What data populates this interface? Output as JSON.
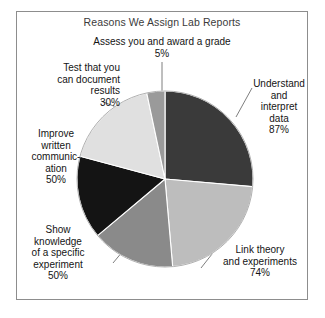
{
  "figure": {
    "title": "Reasons We Assign Lab Reports",
    "frame_color": "#8d8d8d",
    "background": "#ffffff"
  },
  "chart_data": {
    "type": "pie",
    "title": "Reasons We Assign Lab Reports",
    "xlabel": "",
    "ylabel": "",
    "legend_position": "none",
    "grid": false,
    "note": "Percentages are response rates that sum to more than 100% (multiple-select survey); slice angles are drawn proportional to the listed values.",
    "categories": [
      "Understand and interpret data",
      "Link theory and experiments",
      "Show knowledge of a specific experiment",
      "Improve written communication",
      "Test that you can document results",
      "Assess you and award a grade"
    ],
    "values": [
      87,
      74,
      50,
      50,
      30,
      5
    ],
    "value_labels": [
      "87%",
      "74%",
      "50%",
      "50%",
      "30%",
      "5%"
    ],
    "colors": [
      "#3a3a3a",
      "#bdbdbd",
      "#8a8a8a",
      "#141414",
      "#e0e0e0",
      "#9a9a9a"
    ],
    "slices": [
      {
        "name": "Understand and interpret data",
        "value": 87,
        "value_label": "87%",
        "color": "#3a3a3a",
        "start_angle": 0,
        "end_angle": 95,
        "label_lines": "Understand\nand\ninterpret\ndata\n87%"
      },
      {
        "name": "Link theory and experiments",
        "value": 74,
        "value_label": "74%",
        "color": "#bdbdbd",
        "start_angle": 95,
        "end_angle": 175,
        "label_lines": "Link theory\nand experiments\n74%"
      },
      {
        "name": "Show knowledge of a specific experiment",
        "value": 50,
        "value_label": "50%",
        "color": "#8a8a8a",
        "start_angle": 175,
        "end_angle": 230,
        "label_lines": "Show\nknowledge\nof a specific\nexperiment\n50%"
      },
      {
        "name": "Improve written communication",
        "value": 50,
        "value_label": "50%",
        "color": "#141414",
        "start_angle": 230,
        "end_angle": 285,
        "label_lines": "Improve\nwritten\ncommunic-\nation\n50%"
      },
      {
        "name": "Test that you can document results",
        "value": 30,
        "value_label": "30%",
        "color": "#e0e0e0",
        "start_angle": 285,
        "end_angle": 348,
        "label_lines": "Test that you\ncan document\nresults\n30%"
      },
      {
        "name": "Assess you and award a grade",
        "value": 5,
        "value_label": "5%",
        "color": "#9a9a9a",
        "start_angle": 348,
        "end_angle": 360,
        "label_lines": "Assess you and award a grade\n5%"
      }
    ]
  }
}
